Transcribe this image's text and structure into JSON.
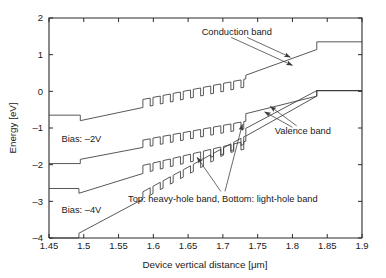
{
  "chart_data": {
    "type": "line",
    "title": "",
    "xlabel": "Device vertical distance [μm]",
    "ylabel": "Energy [eV]",
    "xlim": [
      1.45,
      1.9
    ],
    "ylim": [
      -4,
      2
    ],
    "xticks": [
      "1.45",
      "1.5",
      "1.55",
      "1.6",
      "1.65",
      "1.7",
      "1.75",
      "1.8",
      "1.85",
      "1.9"
    ],
    "xtick_values": [
      1.45,
      1.5,
      1.55,
      1.6,
      1.65,
      1.7,
      1.75,
      1.8,
      1.85,
      1.9
    ],
    "yticks": [
      "2",
      "1",
      "0",
      "–1",
      "–2",
      "–3",
      "–4"
    ],
    "ytick_values": [
      2,
      1,
      0,
      -1,
      -2,
      -3,
      -4
    ],
    "grid": false,
    "legend_position": "none",
    "series": [
      {
        "name": "Conduction band, Bias: –2V",
        "description": "upper conduction band profile with superlattice barriers",
        "points": [
          [
            1.45,
            -0.65
          ],
          [
            1.495,
            -0.65
          ],
          [
            1.495,
            -0.8
          ],
          [
            1.585,
            -0.44
          ],
          [
            1.585,
            -0.22
          ],
          [
            1.5955,
            -0.185
          ],
          [
            1.5955,
            -0.4
          ],
          [
            1.5995,
            -0.385
          ],
          [
            1.5995,
            -0.165
          ],
          [
            1.61,
            -0.13
          ],
          [
            1.61,
            -0.345
          ],
          [
            1.614,
            -0.33
          ],
          [
            1.614,
            -0.11
          ],
          [
            1.6245,
            -0.075
          ],
          [
            1.6245,
            -0.29
          ],
          [
            1.6285,
            -0.275
          ],
          [
            1.6285,
            -0.055
          ],
          [
            1.639,
            -0.02
          ],
          [
            1.639,
            -0.235
          ],
          [
            1.643,
            -0.22
          ],
          [
            1.643,
            0.0
          ],
          [
            1.6535,
            0.035
          ],
          [
            1.6535,
            -0.18
          ],
          [
            1.6575,
            -0.165
          ],
          [
            1.6575,
            0.055
          ],
          [
            1.668,
            0.09
          ],
          [
            1.668,
            -0.125
          ],
          [
            1.672,
            -0.11
          ],
          [
            1.672,
            0.11
          ],
          [
            1.6825,
            0.145
          ],
          [
            1.6825,
            -0.07
          ],
          [
            1.6865,
            -0.055
          ],
          [
            1.6865,
            0.165
          ],
          [
            1.697,
            0.2
          ],
          [
            1.697,
            -0.015
          ],
          [
            1.701,
            0.0
          ],
          [
            1.701,
            0.22
          ],
          [
            1.7115,
            0.255
          ],
          [
            1.7115,
            0.04
          ],
          [
            1.7155,
            0.055
          ],
          [
            1.7155,
            0.275
          ],
          [
            1.726,
            0.31
          ],
          [
            1.726,
            0.095
          ],
          [
            1.73,
            0.11
          ],
          [
            1.73,
            0.33
          ],
          [
            1.733,
            0.34
          ],
          [
            1.733,
            0.44
          ],
          [
            1.835,
            1.14
          ],
          [
            1.835,
            1.35
          ],
          [
            1.9,
            1.35
          ]
        ]
      },
      {
        "name": "Valence band – heavy-hole band, Bias: –2V",
        "description": "upper valence band (heavy hole) profile",
        "points": [
          [
            1.45,
            -1.97
          ],
          [
            1.495,
            -1.97
          ],
          [
            1.495,
            -1.855
          ],
          [
            1.585,
            -1.53
          ],
          [
            1.585,
            -1.33
          ],
          [
            1.5955,
            -1.295
          ],
          [
            1.5955,
            -1.495
          ],
          [
            1.5995,
            -1.48
          ],
          [
            1.5995,
            -1.275
          ],
          [
            1.61,
            -1.24
          ],
          [
            1.61,
            -1.445
          ],
          [
            1.614,
            -1.43
          ],
          [
            1.614,
            -1.225
          ],
          [
            1.6245,
            -1.19
          ],
          [
            1.6245,
            -1.395
          ],
          [
            1.6285,
            -1.38
          ],
          [
            1.6285,
            -1.175
          ],
          [
            1.639,
            -1.14
          ],
          [
            1.639,
            -1.345
          ],
          [
            1.643,
            -1.33
          ],
          [
            1.643,
            -1.125
          ],
          [
            1.6535,
            -1.09
          ],
          [
            1.6535,
            -1.295
          ],
          [
            1.6575,
            -1.28
          ],
          [
            1.6575,
            -1.075
          ],
          [
            1.668,
            -1.04
          ],
          [
            1.668,
            -1.245
          ],
          [
            1.672,
            -1.23
          ],
          [
            1.672,
            -1.025
          ],
          [
            1.6825,
            -0.99
          ],
          [
            1.6825,
            -1.195
          ],
          [
            1.6865,
            -1.18
          ],
          [
            1.6865,
            -0.975
          ],
          [
            1.697,
            -0.94
          ],
          [
            1.697,
            -1.145
          ],
          [
            1.701,
            -1.13
          ],
          [
            1.701,
            -0.925
          ],
          [
            1.7115,
            -0.89
          ],
          [
            1.7115,
            -1.095
          ],
          [
            1.7155,
            -1.08
          ],
          [
            1.7155,
            -0.875
          ],
          [
            1.726,
            -0.84
          ],
          [
            1.726,
            -1.045
          ],
          [
            1.73,
            -1.03
          ],
          [
            1.73,
            -0.825
          ],
          [
            1.733,
            -0.815
          ],
          [
            1.733,
            -0.61
          ],
          [
            1.835,
            -0.13
          ],
          [
            1.835,
            0.02
          ],
          [
            1.9,
            0.02
          ]
        ]
      },
      {
        "name": "Conduction band, Bias: –4V",
        "description": "lower conduction band profile with superlattice barriers",
        "points": [
          [
            1.45,
            -2.65
          ],
          [
            1.493,
            -2.65
          ],
          [
            1.493,
            -2.78
          ],
          [
            1.585,
            -2.24
          ],
          [
            1.585,
            -2.02
          ],
          [
            1.5955,
            -1.975
          ],
          [
            1.5955,
            -2.185
          ],
          [
            1.5995,
            -2.165
          ],
          [
            1.5995,
            -1.955
          ],
          [
            1.61,
            -1.91
          ],
          [
            1.61,
            -2.12
          ],
          [
            1.614,
            -2.1
          ],
          [
            1.614,
            -1.89
          ],
          [
            1.6245,
            -1.845
          ],
          [
            1.6245,
            -2.055
          ],
          [
            1.6285,
            -2.035
          ],
          [
            1.6285,
            -1.825
          ],
          [
            1.639,
            -1.78
          ],
          [
            1.639,
            -1.99
          ],
          [
            1.643,
            -1.97
          ],
          [
            1.643,
            -1.76
          ],
          [
            1.6535,
            -1.715
          ],
          [
            1.6535,
            -1.925
          ],
          [
            1.6575,
            -1.905
          ],
          [
            1.6575,
            -1.695
          ],
          [
            1.668,
            -1.65
          ],
          [
            1.668,
            -1.86
          ],
          [
            1.672,
            -1.84
          ],
          [
            1.672,
            -1.63
          ],
          [
            1.6825,
            -1.585
          ],
          [
            1.6825,
            -1.795
          ],
          [
            1.6865,
            -1.775
          ],
          [
            1.6865,
            -1.565
          ],
          [
            1.697,
            -1.52
          ],
          [
            1.697,
            -1.73
          ],
          [
            1.701,
            -1.71
          ],
          [
            1.701,
            -1.5
          ],
          [
            1.7115,
            -1.455
          ],
          [
            1.7115,
            -1.665
          ],
          [
            1.7155,
            -1.645
          ],
          [
            1.7155,
            -1.435
          ],
          [
            1.726,
            -1.39
          ],
          [
            1.726,
            -1.6
          ],
          [
            1.73,
            -1.58
          ],
          [
            1.73,
            -1.37
          ],
          [
            1.733,
            -1.36
          ],
          [
            1.733,
            -1.22
          ],
          [
            1.835,
            -0.13
          ],
          [
            1.835,
            0.02
          ],
          [
            1.9,
            0.02
          ]
        ]
      },
      {
        "name": "Valence band – light-hole band, Bias: –4V",
        "description": "lower valence band (light hole) profile",
        "points": [
          [
            1.45,
            -4.0
          ],
          [
            1.493,
            -4.0
          ],
          [
            1.493,
            -3.87
          ],
          [
            1.585,
            -2.94
          ],
          [
            1.585,
            -2.74
          ],
          [
            1.5955,
            -2.63
          ],
          [
            1.5955,
            -2.83
          ],
          [
            1.5995,
            -2.79
          ],
          [
            1.5995,
            -2.59
          ],
          [
            1.61,
            -2.48
          ],
          [
            1.61,
            -2.68
          ],
          [
            1.614,
            -2.64
          ],
          [
            1.614,
            -2.44
          ],
          [
            1.6245,
            -2.33
          ],
          [
            1.6245,
            -2.53
          ],
          [
            1.6285,
            -2.49
          ],
          [
            1.6285,
            -2.29
          ],
          [
            1.639,
            -2.18
          ],
          [
            1.639,
            -2.38
          ],
          [
            1.643,
            -2.34
          ],
          [
            1.643,
            -2.14
          ],
          [
            1.6535,
            -2.03
          ],
          [
            1.6535,
            -2.23
          ],
          [
            1.6575,
            -2.19
          ],
          [
            1.6575,
            -1.99
          ],
          [
            1.668,
            -1.88
          ],
          [
            1.668,
            -2.08
          ],
          [
            1.672,
            -2.04
          ],
          [
            1.672,
            -1.84
          ],
          [
            1.6825,
            -1.73
          ],
          [
            1.6825,
            -1.93
          ],
          [
            1.6865,
            -1.89
          ],
          [
            1.6865,
            -1.69
          ],
          [
            1.697,
            -1.58
          ],
          [
            1.697,
            -1.78
          ],
          [
            1.701,
            -1.74
          ],
          [
            1.701,
            -1.54
          ],
          [
            1.7115,
            -1.43
          ],
          [
            1.7115,
            -1.63
          ],
          [
            1.7155,
            -1.59
          ],
          [
            1.7155,
            -1.39
          ],
          [
            1.726,
            -1.28
          ],
          [
            1.726,
            -1.48
          ],
          [
            1.73,
            -1.44
          ],
          [
            1.73,
            -1.24
          ],
          [
            1.733,
            -1.21
          ],
          [
            1.733,
            -1.01
          ],
          [
            1.835,
            0.02
          ],
          [
            1.835,
            0.02
          ],
          [
            1.9,
            0.02
          ]
        ]
      }
    ],
    "annotations": [
      {
        "id": "conduction-band",
        "text": "Conduction band",
        "x": 1.72,
        "y": 1.62,
        "arrows": [
          {
            "x1": 1.735,
            "y1": 1.47,
            "x2": 1.797,
            "y2": 0.93
          },
          {
            "x1": 1.712,
            "y1": 1.47,
            "x2": 1.8,
            "y2": 0.71
          }
        ]
      },
      {
        "id": "valence-band",
        "text": "Valence band",
        "x": 1.815,
        "y": -1.08,
        "arrows": [
          {
            "x1": 1.806,
            "y1": -0.94,
            "x2": 1.768,
            "y2": -0.41
          },
          {
            "x1": 1.8,
            "y1": -0.98,
            "x2": 1.76,
            "y2": -0.56
          }
        ]
      },
      {
        "id": "hole-band-note",
        "text": "Top: heavy-hole band, Bottom: light-hole band",
        "x": 1.7,
        "y": -2.92,
        "arrows": [
          {
            "x1": 1.697,
            "y1": -2.73,
            "x2": 1.663,
            "y2": -1.8
          },
          {
            "x1": 1.703,
            "y1": -2.73,
            "x2": 1.728,
            "y2": -0.9
          }
        ]
      }
    ],
    "bias_labels": [
      {
        "id": "bias-2v",
        "text": "Bias: –2V",
        "x": 1.468,
        "y": -1.3
      },
      {
        "id": "bias-4v",
        "text": "Bias: –4V",
        "x": 1.468,
        "y": -3.22
      }
    ]
  },
  "axis": {
    "x_title": "Device vertical distance [μm]",
    "y_title": "Energy [eV]"
  },
  "colors": {
    "curve": "#3a3a3a",
    "axis": "#2b2b2b",
    "text": "#1a1a1a",
    "background": "#ffffff"
  }
}
